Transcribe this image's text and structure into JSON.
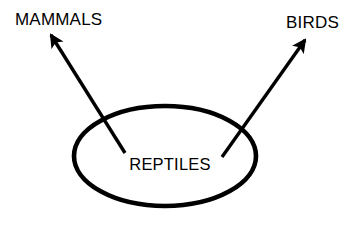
{
  "diagram": {
    "background_color": "#ffffff",
    "stroke_color": "#000000",
    "group": {
      "label": "REPTILES",
      "shape": "ellipse",
      "center_x": 165,
      "center_y": 156,
      "radius_x": 91,
      "radius_y": 50,
      "stroke_width": 4.6
    },
    "branches": [
      {
        "id": "mammals",
        "label": "MAMMALS",
        "label_x": 15,
        "label_y": 25,
        "arrow_from_x": 125,
        "arrow_from_y": 153,
        "arrow_to_x": 51,
        "arrow_to_y": 35,
        "stroke_width": 3.4
      },
      {
        "id": "birds",
        "label": "BIRDS",
        "label_x": 286,
        "label_y": 28,
        "arrow_from_x": 222,
        "arrow_from_y": 157,
        "arrow_to_x": 305,
        "arrow_to_y": 40,
        "stroke_width": 3.4
      }
    ]
  }
}
